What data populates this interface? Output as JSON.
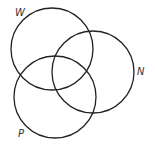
{
  "diagram": {
    "type": "venn",
    "stroke_color": "#222222",
    "sets": [
      {
        "id": "W",
        "label": "W",
        "cx": 52,
        "cy": 49,
        "r": 41,
        "label_x": 15,
        "label_y": 16
      },
      {
        "id": "N",
        "label": "N",
        "cx": 93,
        "cy": 72,
        "r": 41,
        "label_x": 137,
        "label_y": 75
      },
      {
        "id": "P",
        "label": "P",
        "cx": 55,
        "cy": 97,
        "r": 41,
        "label_x": 18,
        "label_y": 137
      }
    ]
  }
}
